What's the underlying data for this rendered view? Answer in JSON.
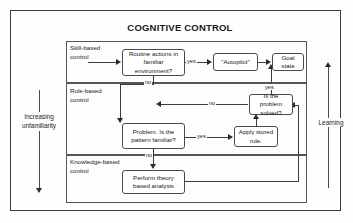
{
  "figure": {
    "title": "COGNITIVE CONTROL"
  },
  "bands": [
    {
      "id": "skill",
      "label": "Skill-based\ncontrol"
    },
    {
      "id": "rule",
      "label": "Rule-based\ncontrol"
    },
    {
      "id": "know",
      "label": "Knowledge-based\ncontrol"
    }
  ],
  "nodes": {
    "routine": "Routine actions in familiar environment?",
    "autopilot": "\"Autopilot\"",
    "goal": "Goal state",
    "solved": "Is the problem solved?",
    "pattern": "Problem. Is the pattern familiar?",
    "apply": "Apply stored rule.",
    "perform": "Perform theory based analysis"
  },
  "edge_labels": {
    "routine_yes": "yes",
    "routine_no": "no",
    "solved_yes": "yes",
    "solved_no": "no",
    "pattern_yes": "yes",
    "pattern_no": "no"
  },
  "axes": {
    "left": "Increasing\nunfamiliarity",
    "right": "Learning"
  },
  "colors": {
    "line": "#3c3c3c",
    "text": "#161616",
    "background": "#fdfdfd"
  }
}
